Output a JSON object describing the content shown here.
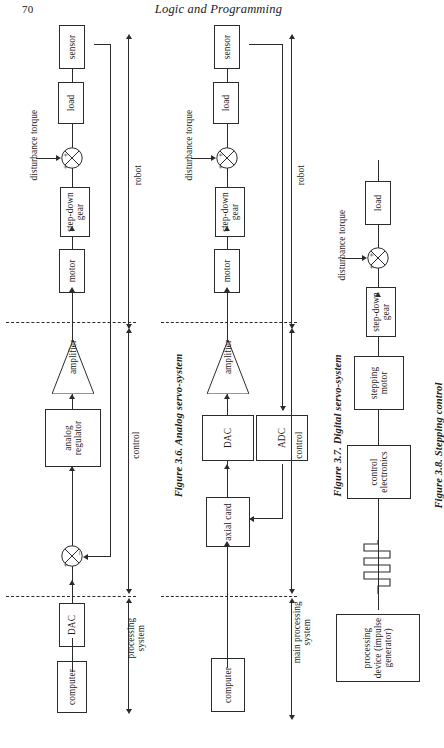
{
  "page": {
    "folio": "70",
    "running_head": "Logic and Programming"
  },
  "figures": [
    {
      "id": "figure-3-6",
      "caption_number": "Figure 3.6.",
      "caption_title": "Analog servo-system",
      "caption_full": "Figure 3.6. Analog servo-system",
      "blocks": [
        {
          "name": "sensor",
          "label": "sensor"
        },
        {
          "name": "load",
          "label": "load"
        },
        {
          "name": "step-down-gear",
          "label": "step-down gear"
        },
        {
          "name": "motor",
          "label": "motor"
        },
        {
          "name": "amplifier",
          "label": "amplifier"
        },
        {
          "name": "analog-regulator",
          "label": "analog regulator"
        },
        {
          "name": "dac",
          "label": "DAC"
        },
        {
          "name": "computer",
          "label": "computer"
        }
      ],
      "annotations": {
        "disturbance_torque": "disturbance torque",
        "robot": "robot",
        "control": "control",
        "processing_system": "processing system"
      },
      "summing_signs_top": [
        "+",
        "+"
      ],
      "summing_signs_bottom": [
        "+",
        "–"
      ]
    },
    {
      "id": "figure-3-7",
      "caption_number": "Figure 3.7.",
      "caption_title": "Digital servo-system",
      "caption_full": "Figure 3.7. Digital servo-system",
      "blocks": [
        {
          "name": "sensor",
          "label": "sensor"
        },
        {
          "name": "load",
          "label": "load"
        },
        {
          "name": "step-down-gear",
          "label": "step-down gear"
        },
        {
          "name": "motor",
          "label": "motor"
        },
        {
          "name": "amplifier",
          "label": "amplifier"
        },
        {
          "name": "dac",
          "label": "DAC"
        },
        {
          "name": "adc",
          "label": "ADC"
        },
        {
          "name": "axial-card",
          "label": "axial card"
        },
        {
          "name": "computer",
          "label": "computer"
        }
      ],
      "annotations": {
        "disturbance_torque": "disturbance torque",
        "robot": "robot",
        "control": "control",
        "main_processing_system": "main processing system"
      },
      "summing_signs_top": [
        "+",
        "+"
      ]
    },
    {
      "id": "figure-3-8",
      "caption_number": "Figure 3.8.",
      "caption_title": "Stepping control",
      "caption_full": "Figure 3.8. Stepping control",
      "blocks": [
        {
          "name": "load",
          "label": "load"
        },
        {
          "name": "step-down-gear",
          "label": "step-down gear"
        },
        {
          "name": "stepping-motor",
          "label": "stepping motor"
        },
        {
          "name": "control-electronics",
          "label": "control electronics"
        },
        {
          "name": "processing-device",
          "label": "processing device (impulse generator)"
        }
      ],
      "annotations": {
        "disturbance_torque": "disturbance torque"
      },
      "summing_signs_top": [
        "+",
        "+"
      ]
    }
  ]
}
